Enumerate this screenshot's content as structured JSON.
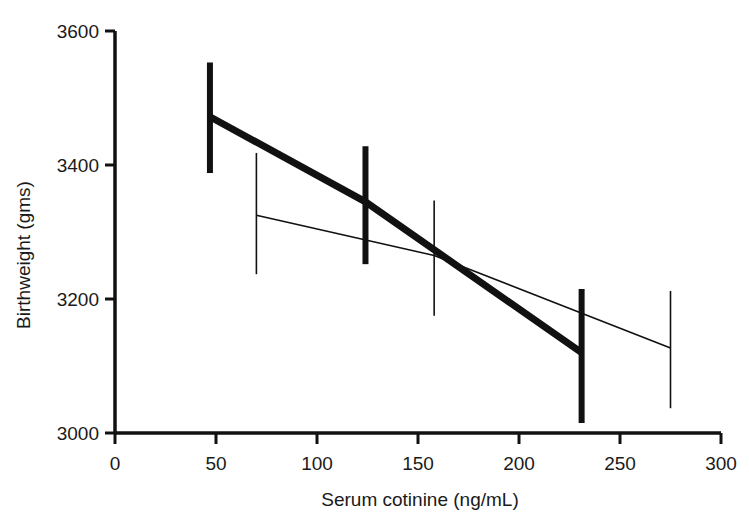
{
  "chart_data": {
    "type": "line",
    "title": "",
    "xlabel": "Serum cotinine (ng/mL)",
    "ylabel": "Birthweight (gms)",
    "xlim": [
      0,
      300
    ],
    "ylim": [
      3000,
      3600
    ],
    "xticks": [
      0,
      50,
      100,
      150,
      200,
      250,
      300
    ],
    "xtick_labels": [
      "0",
      "50",
      "100",
      "150",
      "200",
      "250",
      "300"
    ],
    "yticks": [
      3000,
      3200,
      3400,
      3600
    ],
    "ytick_labels": [
      "3000",
      "3200",
      "3400",
      "3600"
    ],
    "grid": false,
    "legend": "none",
    "series": [
      {
        "name": "thick-series",
        "style": "thick",
        "x": [
          47,
          124,
          231
        ],
        "values": [
          3472,
          3345,
          3120
        ],
        "error_low": [
          3388,
          3252,
          3015
        ],
        "error_high": [
          3553,
          3428,
          3215
        ]
      },
      {
        "name": "thin-series",
        "style": "thin",
        "x": [
          70,
          158,
          275
        ],
        "values": [
          3325,
          3265,
          3127
        ],
        "error_low": [
          3237,
          3175,
          3037
        ],
        "error_high": [
          3418,
          3347,
          3212
        ]
      }
    ]
  },
  "axis": {
    "x_title": "Serum cotinine (ng/mL)",
    "y_title": "Birthweight (gms)",
    "x_tick_0": "0",
    "x_tick_1": "50",
    "x_tick_2": "100",
    "x_tick_3": "150",
    "x_tick_4": "200",
    "x_tick_5": "250",
    "x_tick_6": "300",
    "y_tick_0": "3000",
    "y_tick_1": "3200",
    "y_tick_2": "3400",
    "y_tick_3": "3600"
  },
  "colors": {
    "ink": "#111111",
    "background": "#ffffff"
  }
}
